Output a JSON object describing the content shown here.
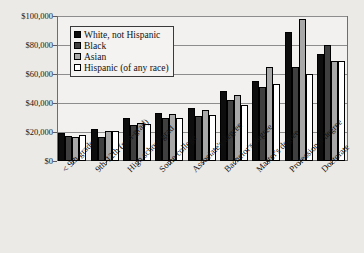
{
  "chart_data": {
    "type": "bar",
    "title": "",
    "subtitle": "",
    "xlabel": "",
    "ylabel": "",
    "ylim": [
      0,
      100000
    ],
    "ytick_labels": [
      "$100,000",
      "$80,000",
      "$60,000",
      "$40,000",
      "$20,000",
      "$0"
    ],
    "ytick_values": [
      100000,
      80000,
      60000,
      40000,
      20000,
      0
    ],
    "grid": true,
    "legend_position": "upper-left-inside",
    "categories": [
      "< 9th grade",
      "9th-12th (non-grad)",
      "High school grad",
      "Some college",
      "Associate's degree",
      "Bachelor's degree",
      "Master's degree",
      "Professional degree",
      "Doctorate"
    ],
    "series": [
      {
        "name": "White, not Hispanic",
        "color": "#0d0d0d",
        "values": [
          19500,
          22000,
          30000,
          33000,
          36500,
          48000,
          55000,
          89000,
          74000
        ]
      },
      {
        "name": "Black",
        "color": "#3f3f3f",
        "values": [
          17500,
          16500,
          25000,
          30000,
          31000,
          42000,
          51000,
          65000,
          80000
        ]
      },
      {
        "name": "Asian",
        "color": "#a8a8a8",
        "values": [
          16500,
          20500,
          26500,
          32500,
          35000,
          45500,
          65000,
          98000,
          69000
        ]
      },
      {
        "name": "Hispanic (of any race)",
        "color": "#ffffff",
        "values": [
          18000,
          20500,
          25500,
          30000,
          31500,
          38500,
          53000,
          60000,
          69000
        ]
      }
    ]
  },
  "legend": {
    "items": [
      {
        "label": "White, not Hispanic",
        "swatch": "#0d0d0d"
      },
      {
        "label": "Black",
        "swatch": "#3f3f3f"
      },
      {
        "label": "Asian",
        "swatch": "#a8a8a8"
      },
      {
        "label": "Hispanic (of any race)",
        "swatch": "#ffffff"
      }
    ]
  }
}
